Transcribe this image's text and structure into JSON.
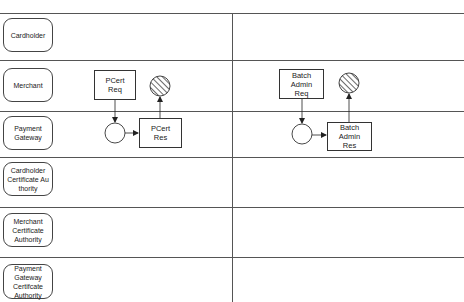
{
  "diagram": {
    "type": "swimlane-process",
    "lanes": [
      {
        "id": "cardholder",
        "label": "Cardholder"
      },
      {
        "id": "merchant",
        "label": "Merchant"
      },
      {
        "id": "payment-gateway",
        "label": "Payment Gateway"
      },
      {
        "id": "cardholder-ca",
        "label": "Cardholder Certificate Au thority"
      },
      {
        "id": "merchant-ca",
        "label": "Merchant Certificate Authority"
      },
      {
        "id": "pg-ca",
        "label": "Payment Gateway Certifcate Authority"
      }
    ],
    "tasks": {
      "pcert_req": "PCert\nReq",
      "pcert_res": "PCert\nRes",
      "batch_req": "Batch\nAdmin\nReq",
      "batch_res": "Batch\nAdmin\nRes"
    },
    "events": [
      {
        "id": "pcert-start",
        "kind": "circle"
      },
      {
        "id": "pcert-end",
        "kind": "hatched-circle"
      },
      {
        "id": "batch-start",
        "kind": "circle"
      },
      {
        "id": "batch-end",
        "kind": "hatched-circle"
      }
    ],
    "flows": [
      {
        "from": "PCert Req",
        "to": "pcert-start"
      },
      {
        "from": "pcert-start",
        "to": "PCert Res"
      },
      {
        "from": "PCert Res",
        "to": "pcert-end"
      },
      {
        "from": "Batch Admin Req",
        "to": "batch-start"
      },
      {
        "from": "batch-start",
        "to": "Batch Admin Res"
      },
      {
        "from": "Batch Admin Res",
        "to": "batch-end"
      }
    ]
  }
}
